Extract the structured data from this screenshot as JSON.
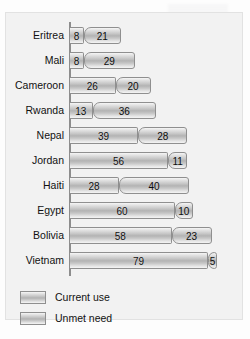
{
  "chart_data": {
    "type": "bar",
    "orientation": "horizontal",
    "stacked": true,
    "title": "",
    "subtitle": "",
    "xlabel": "",
    "ylabel": "",
    "grid": false,
    "axis_tick_labels": [],
    "xlim": [
      0,
      84
    ],
    "legend_position": "bottom-left",
    "categories": [
      "Eritrea",
      "Mali",
      "Cameroon",
      "Rwanda",
      "Nepal",
      "Jordan",
      "Haiti",
      "Egypt",
      "Bolivia",
      "Vietnam"
    ],
    "series": [
      {
        "name": "Current use",
        "values": [
          8,
          8,
          26,
          13,
          39,
          56,
          28,
          60,
          58,
          79
        ]
      },
      {
        "name": "Unmet need",
        "values": [
          21,
          29,
          20,
          36,
          28,
          11,
          40,
          10,
          23,
          5
        ]
      }
    ],
    "totals": [
      29,
      37,
      46,
      49,
      67,
      67,
      68,
      70,
      81,
      84
    ]
  },
  "legend": {
    "items": [
      {
        "label": "Current use",
        "swatch_name": "legend-swatch-current-use"
      },
      {
        "label": "Unmet need",
        "swatch_name": "legend-swatch-unmet-need"
      }
    ]
  },
  "style": {
    "plot_background": "#f2f2f2",
    "page_background": "#fdfdfd",
    "bar_border": "#8f8f8f",
    "axis_color": "#8d8d8d",
    "text_color": "#111111"
  }
}
